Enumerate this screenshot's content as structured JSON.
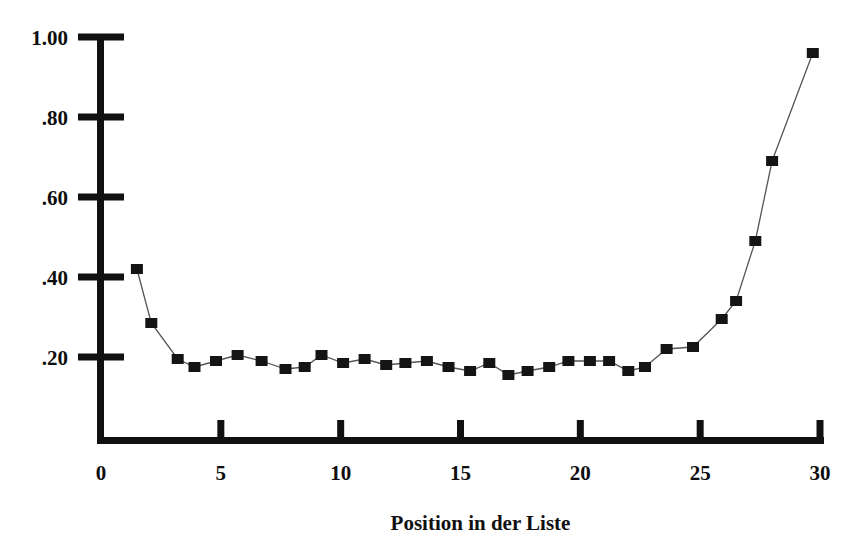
{
  "chart_data": {
    "type": "line",
    "title": "",
    "subtitle": "",
    "xlabel": "Position in der Liste",
    "ylabel": "",
    "xlim": [
      0,
      30
    ],
    "ylim": [
      0,
      1.0
    ],
    "xticks": [
      0,
      5,
      10,
      15,
      20,
      25,
      30
    ],
    "xtick_labels": [
      "0",
      "5",
      "10",
      "15",
      "20",
      "25",
      "30"
    ],
    "yticks": [
      0.2,
      0.4,
      0.6,
      0.8,
      1.0
    ],
    "ytick_labels": [
      ".20",
      ".40",
      ".60",
      ".80",
      "1.00"
    ],
    "grid": false,
    "legend": null,
    "marker": "square",
    "marker_color": "#141414",
    "line_color": "#555555",
    "series": [
      {
        "name": "",
        "x": [
          1.5,
          2.1,
          3.2,
          3.9,
          4.8,
          5.7,
          6.7,
          7.7,
          8.5,
          9.2,
          10.1,
          11.0,
          11.9,
          12.7,
          13.6,
          14.5,
          15.4,
          16.2,
          17.0,
          17.8,
          18.7,
          19.5,
          20.4,
          21.2,
          22.0,
          22.7,
          23.6,
          24.7,
          25.9,
          26.5,
          27.3,
          28.0,
          29.7
        ],
        "y": [
          0.42,
          0.285,
          0.195,
          0.175,
          0.19,
          0.205,
          0.19,
          0.17,
          0.175,
          0.205,
          0.185,
          0.195,
          0.18,
          0.185,
          0.19,
          0.175,
          0.165,
          0.185,
          0.155,
          0.165,
          0.175,
          0.19,
          0.19,
          0.19,
          0.165,
          0.175,
          0.22,
          0.225,
          0.295,
          0.34,
          0.49,
          0.69,
          0.96
        ]
      }
    ]
  },
  "axis": {
    "x_title": "Position in der Liste"
  }
}
